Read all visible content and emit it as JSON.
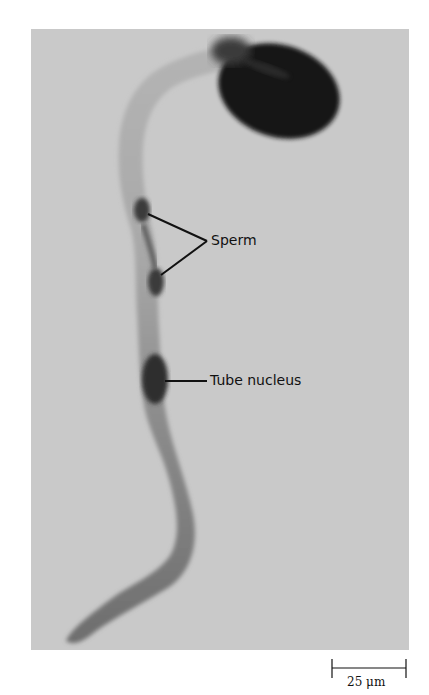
{
  "figure": {
    "labels": {
      "sperm": "Sperm",
      "tube_nucleus": "Tube nucleus"
    },
    "scale_bar": {
      "value": "25 μm"
    },
    "colors": {
      "background": "#c9c9c9",
      "tube": "#8a8a8a",
      "pollen_grain": "#141414",
      "nuclei": "#3a3a3a",
      "label_lines": "#111111"
    }
  }
}
